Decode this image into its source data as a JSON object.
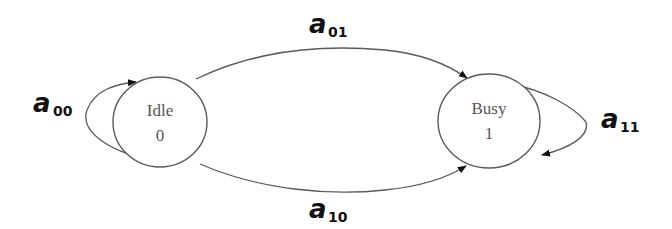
{
  "diagram": {
    "type": "state-transition",
    "nodes": [
      {
        "id": "idle",
        "name": "Idle",
        "value": "0"
      },
      {
        "id": "busy",
        "name": "Busy",
        "value": "1"
      }
    ],
    "edges": [
      {
        "from": "idle",
        "to": "idle",
        "symbol": "a",
        "subscript": "00"
      },
      {
        "from": "idle",
        "to": "busy",
        "symbol": "a",
        "subscript": "01"
      },
      {
        "from": "idle",
        "to": "busy",
        "symbol": "a",
        "subscript": "10"
      },
      {
        "from": "busy",
        "to": "busy",
        "symbol": "a",
        "subscript": "11"
      }
    ],
    "colors": {
      "stroke": "#5a5a5a",
      "label": "#111111",
      "node_text": "#555555",
      "background": "#ffffff"
    }
  }
}
